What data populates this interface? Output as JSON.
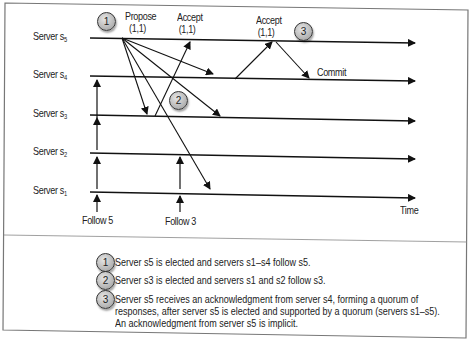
{
  "diagram": {
    "servers": [
      {
        "id": "s5",
        "label": "Server s",
        "sub": "5"
      },
      {
        "id": "s4",
        "label": "Server s",
        "sub": "4"
      },
      {
        "id": "s3",
        "label": "Server s",
        "sub": "3"
      },
      {
        "id": "s2",
        "label": "Server s",
        "sub": "2"
      },
      {
        "id": "s1",
        "label": "Server s",
        "sub": "1"
      }
    ],
    "messages": {
      "propose": {
        "title": "Propose",
        "value": "(1,1)"
      },
      "accept1": {
        "title": "Accept",
        "value": "(1,1)"
      },
      "accept2": {
        "title": "Accept",
        "value": "(1,1)"
      },
      "commit": "Commit"
    },
    "follow_labels": {
      "follow5": "Follow 5",
      "follow3": "Follow 3"
    },
    "time_label": "Time",
    "badges": [
      "1",
      "2",
      "3"
    ]
  },
  "notes": [
    {
      "badge": "1",
      "lines": [
        "Server s5 is elected and servers s1–s4 follow s5."
      ]
    },
    {
      "badge": "2",
      "lines": [
        "Server s3 is elected and servers s1 and s2 follow s3."
      ]
    },
    {
      "badge": "3",
      "lines": [
        "Server s5 receives an acknowledgment from server s4, forming a quorum of",
        "responses, after server s5 is elected and supported by a quorum (servers s1–s5).",
        "An acknowledgment from server s5 is implicit."
      ]
    }
  ]
}
